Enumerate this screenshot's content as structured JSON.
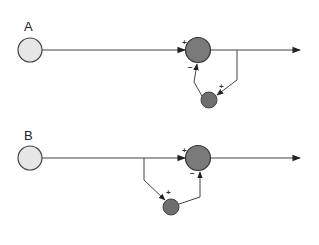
{
  "diagram": {
    "panels": [
      {
        "label": "A",
        "type": "feedback",
        "input_sign": "+",
        "inhibit_sign": "−",
        "excite_sign": "+"
      },
      {
        "label": "B",
        "type": "feedforward",
        "input_sign": "+",
        "inhibit_sign": "−",
        "excite_sign": "+"
      }
    ],
    "colors": {
      "source_node": "#e6e6e6",
      "main_node": "#7a7a7a",
      "inter_node": "#6e6e6e",
      "line": "#444444"
    }
  }
}
